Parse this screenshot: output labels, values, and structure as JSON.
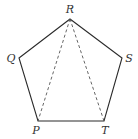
{
  "diagram": {
    "type": "geometry",
    "shape": "regular-pentagon",
    "colors": {
      "stroke": "#2a2a2a",
      "label": "#333333",
      "background": "#ffffff"
    },
    "vertices": [
      {
        "id": "R",
        "label": "R",
        "x": 70,
        "y": 19,
        "label_x": 70,
        "label_y": 13
      },
      {
        "id": "S",
        "label": "S",
        "x": 122,
        "y": 58,
        "label_x": 129,
        "label_y": 62
      },
      {
        "id": "T",
        "label": "T",
        "x": 104,
        "y": 121,
        "label_x": 105,
        "label_y": 134
      },
      {
        "id": "P",
        "label": "P",
        "x": 38,
        "y": 121,
        "label_x": 36,
        "label_y": 134
      },
      {
        "id": "Q",
        "label": "Q",
        "x": 19,
        "y": 58,
        "label_x": 11,
        "label_y": 62
      }
    ],
    "edges": [
      {
        "from": "R",
        "to": "S",
        "style": "solid"
      },
      {
        "from": "S",
        "to": "T",
        "style": "solid"
      },
      {
        "from": "T",
        "to": "P",
        "style": "solid"
      },
      {
        "from": "P",
        "to": "Q",
        "style": "solid"
      },
      {
        "from": "Q",
        "to": "R",
        "style": "solid"
      }
    ],
    "diagonals": [
      {
        "from": "R",
        "to": "P",
        "style": "dashed"
      },
      {
        "from": "R",
        "to": "T",
        "style": "dashed"
      }
    ]
  }
}
